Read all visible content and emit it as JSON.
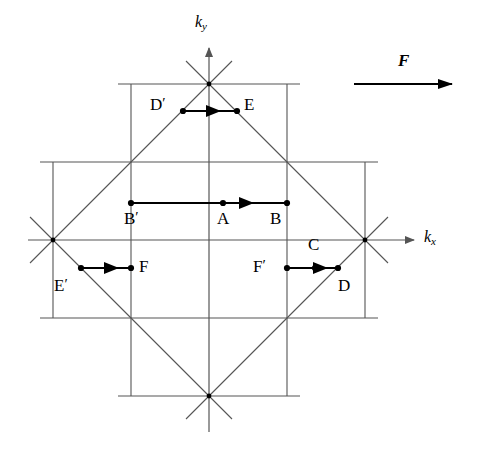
{
  "figure": {
    "background_color": "#ffffff",
    "line_color": "#555555",
    "accent_color": "#000000",
    "width": 478,
    "height": 452
  },
  "axes": {
    "kx_label": "k",
    "kx_subscript": "x",
    "ky_label": "k",
    "ky_subscript": "y",
    "origin": {
      "x": 209,
      "y": 240
    }
  },
  "force": {
    "label": "F",
    "arrow_start_x": 354,
    "arrow_end_x": 452,
    "arrow_y": 84,
    "label_x": 403,
    "label_y": 62
  },
  "grid": {
    "spacing": 78,
    "vertical_x": [
      53,
      131,
      209,
      287,
      365
    ],
    "horizontal_y": [
      84,
      162,
      240,
      318,
      396
    ]
  },
  "zone": {
    "shape": "diamond",
    "vertices": [
      {
        "name": "top",
        "x": 209,
        "y": 84
      },
      {
        "name": "right",
        "x": 365,
        "y": 240
      },
      {
        "name": "bottom",
        "x": 209,
        "y": 396
      },
      {
        "name": "left",
        "x": 53,
        "y": 240
      }
    ]
  },
  "points": [
    {
      "id": "D-prime",
      "label": "D",
      "prime": true,
      "x": 183,
      "y": 111,
      "label_x": 151,
      "label_y": 98
    },
    {
      "id": "E",
      "label": "E",
      "prime": false,
      "x": 237,
      "y": 111,
      "label_x": 244,
      "label_y": 98
    },
    {
      "id": "B-prime",
      "label": "B",
      "prime": true,
      "x": 131,
      "y": 203,
      "label_x": 131,
      "label_y": 210
    },
    {
      "id": "A",
      "label": "A",
      "prime": false,
      "x": 223,
      "y": 203,
      "label_x": 216,
      "label_y": 210
    },
    {
      "id": "B",
      "label": "B",
      "prime": false,
      "x": 287,
      "y": 203,
      "label_x": 271,
      "label_y": 210
    },
    {
      "id": "E-prime",
      "label": "E",
      "prime": true,
      "x": 81,
      "y": 268,
      "label_x": 56,
      "label_y": 277
    },
    {
      "id": "F",
      "label": "F",
      "prime": false,
      "x": 131,
      "y": 268,
      "label_x": 139,
      "label_y": 256
    },
    {
      "id": "F-prime",
      "label": "F",
      "prime": true,
      "x": 287,
      "y": 268,
      "label_x": 253,
      "label_y": 256
    },
    {
      "id": "C",
      "label": "C",
      "prime": false,
      "x": 315,
      "y": 268,
      "label_x": 307,
      "label_y": 237
    },
    {
      "id": "D",
      "label": "D",
      "prime": false,
      "x": 338,
      "y": 268,
      "label_x": 339,
      "label_y": 277
    }
  ],
  "trajectory_arrows": [
    {
      "id": "arrow-Dprime-E",
      "from_x": 183,
      "to_x": 237,
      "y": 111,
      "head_x": 219
    },
    {
      "id": "arrow-Bprime-B",
      "from_x": 131,
      "to_x": 287,
      "y": 203,
      "head_x": 252
    },
    {
      "id": "arrow-Eprime-F",
      "from_x": 81,
      "to_x": 131,
      "y": 268,
      "head_x": 117
    },
    {
      "id": "arrow-Fprime-D",
      "from_x": 287,
      "to_x": 338,
      "y": 268,
      "head_x": 326
    }
  ]
}
